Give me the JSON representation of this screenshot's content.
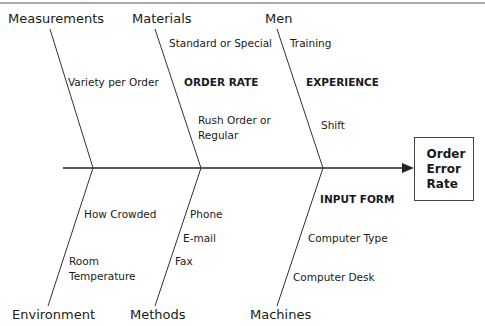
{
  "diagram": {
    "type": "fishbone",
    "effect": "Order\nError\nRate",
    "categories": {
      "top": [
        {
          "name": "Measurements",
          "causes": [
            "Variety per Order"
          ],
          "subheadings": []
        },
        {
          "name": "Materials",
          "causes": [
            "Standard or Special",
            "Rush Order or",
            "Regular"
          ],
          "subheadings": [
            "ORDER RATE"
          ]
        },
        {
          "name": "Men",
          "causes": [
            "Training",
            "Shift"
          ],
          "subheadings": [
            "EXPERIENCE"
          ]
        }
      ],
      "bottom": [
        {
          "name": "Environment",
          "causes": [
            "How Crowded",
            "Room",
            "Temperature"
          ],
          "subheadings": []
        },
        {
          "name": "Methods",
          "causes": [
            "Phone",
            "E-mail",
            "Fax"
          ],
          "subheadings": []
        },
        {
          "name": "Machines",
          "causes": [
            "Computer Type",
            "Computer Desk"
          ],
          "subheadings": [
            "INPUT FORM"
          ]
        }
      ]
    }
  }
}
